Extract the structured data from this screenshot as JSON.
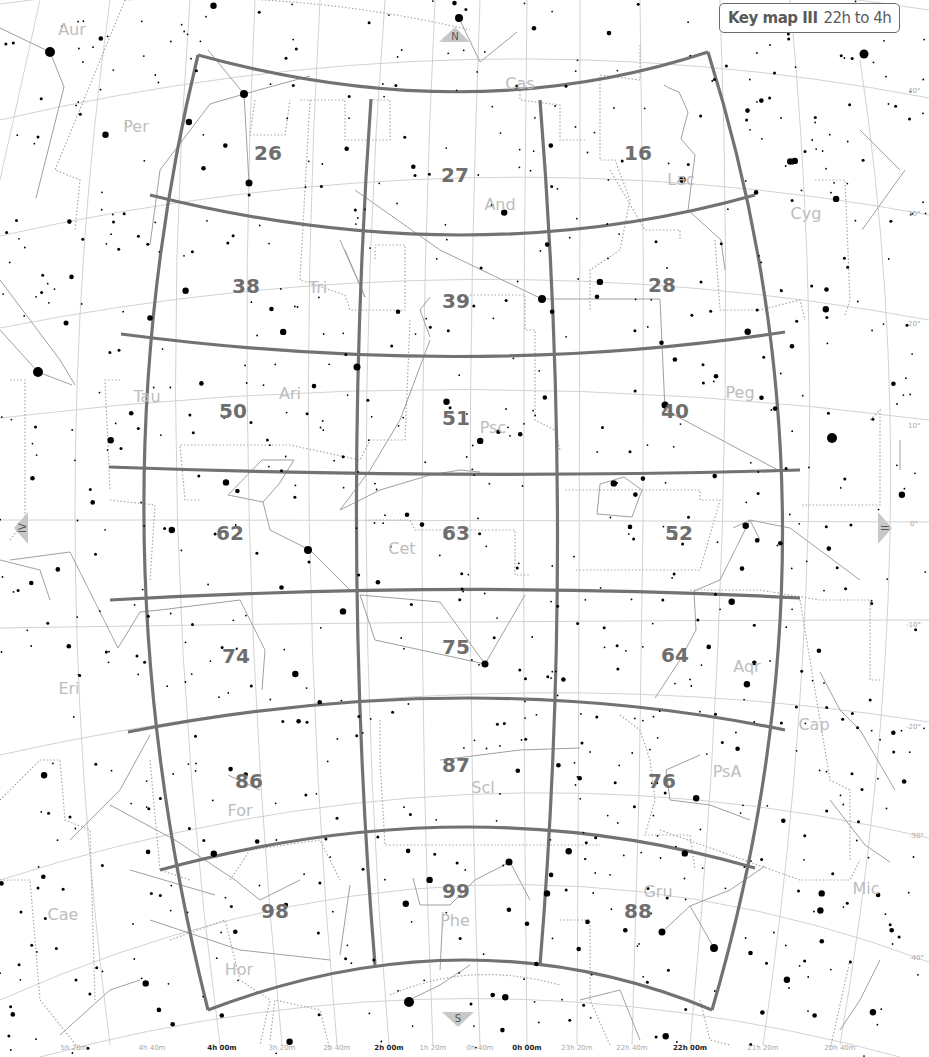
{
  "key_map": {
    "title": "Key map III",
    "range": "22h to 4h"
  },
  "direction_markers": {
    "north": "N",
    "south": "S",
    "east": "IV",
    "west": "II"
  },
  "chart_numbers": [
    {
      "label": "26",
      "x": 268,
      "y": 160
    },
    {
      "label": "27",
      "x": 455,
      "y": 182
    },
    {
      "label": "16",
      "x": 638,
      "y": 160
    },
    {
      "label": "38",
      "x": 246,
      "y": 293
    },
    {
      "label": "39",
      "x": 456,
      "y": 308
    },
    {
      "label": "28",
      "x": 662,
      "y": 292
    },
    {
      "label": "50",
      "x": 233,
      "y": 418
    },
    {
      "label": "51",
      "x": 456,
      "y": 425
    },
    {
      "label": "40",
      "x": 675,
      "y": 418
    },
    {
      "label": "62",
      "x": 230,
      "y": 540
    },
    {
      "label": "63",
      "x": 456,
      "y": 540
    },
    {
      "label": "52",
      "x": 679,
      "y": 540
    },
    {
      "label": "74",
      "x": 236,
      "y": 663
    },
    {
      "label": "75",
      "x": 456,
      "y": 654
    },
    {
      "label": "64",
      "x": 675,
      "y": 662
    },
    {
      "label": "86",
      "x": 249,
      "y": 788
    },
    {
      "label": "87",
      "x": 456,
      "y": 772
    },
    {
      "label": "76",
      "x": 662,
      "y": 788
    },
    {
      "label": "98",
      "x": 275,
      "y": 918
    },
    {
      "label": "99",
      "x": 456,
      "y": 898
    },
    {
      "label": "88",
      "x": 638,
      "y": 918
    }
  ],
  "constellations": [
    {
      "abbr": "Aur",
      "x": 72,
      "y": 35
    },
    {
      "abbr": "Per",
      "x": 136,
      "y": 132
    },
    {
      "abbr": "Cas",
      "x": 520,
      "y": 89
    },
    {
      "abbr": "And",
      "x": 500,
      "y": 210
    },
    {
      "abbr": "Lac",
      "x": 681,
      "y": 185
    },
    {
      "abbr": "Cyg",
      "x": 806,
      "y": 219
    },
    {
      "abbr": "Tri",
      "x": 318,
      "y": 293
    },
    {
      "abbr": "Tau",
      "x": 147,
      "y": 402
    },
    {
      "abbr": "Ari",
      "x": 290,
      "y": 399
    },
    {
      "abbr": "Psc",
      "x": 493,
      "y": 433
    },
    {
      "abbr": "Peg",
      "x": 740,
      "y": 398
    },
    {
      "abbr": "Cet",
      "x": 402,
      "y": 554
    },
    {
      "abbr": "Eri",
      "x": 69,
      "y": 694
    },
    {
      "abbr": "Aqr",
      "x": 747,
      "y": 672
    },
    {
      "abbr": "Cap",
      "x": 814,
      "y": 730
    },
    {
      "abbr": "For",
      "x": 240,
      "y": 816
    },
    {
      "abbr": "Scl",
      "x": 483,
      "y": 793
    },
    {
      "abbr": "PsA",
      "x": 727,
      "y": 777
    },
    {
      "abbr": "Mic",
      "x": 866,
      "y": 894
    },
    {
      "abbr": "Cae",
      "x": 63,
      "y": 920
    },
    {
      "abbr": "Phe",
      "x": 455,
      "y": 926
    },
    {
      "abbr": "Gru",
      "x": 658,
      "y": 897
    },
    {
      "abbr": "Hor",
      "x": 239,
      "y": 975
    }
  ],
  "declination_labels": [
    {
      "label": "40°",
      "x": 908,
      "y": 93
    },
    {
      "label": "30°",
      "x": 908,
      "y": 216
    },
    {
      "label": "20°",
      "x": 908,
      "y": 326
    },
    {
      "label": "10°",
      "x": 908,
      "y": 428
    },
    {
      "label": "0°",
      "x": 910,
      "y": 526
    },
    {
      "label": "-10°",
      "x": 906,
      "y": 627
    },
    {
      "label": "-20°",
      "x": 906,
      "y": 729
    },
    {
      "label": "-30°",
      "x": 909,
      "y": 838
    },
    {
      "label": "-40°",
      "x": 909,
      "y": 960
    }
  ],
  "ra_labels": [
    {
      "label": "5h 20m",
      "x": 74,
      "y": 1050,
      "major": false
    },
    {
      "label": "4h 40m",
      "x": 152,
      "y": 1050,
      "major": false
    },
    {
      "label": "4h 00m",
      "x": 222,
      "y": 1050,
      "major": true
    },
    {
      "label": "3h 20m",
      "x": 282,
      "y": 1050,
      "major": false
    },
    {
      "label": "2h 40m",
      "x": 337,
      "y": 1050,
      "major": false
    },
    {
      "label": "2h 00m",
      "x": 389,
      "y": 1050,
      "major": true
    },
    {
      "label": "1h 20m",
      "x": 433,
      "y": 1050,
      "major": false
    },
    {
      "label": "0h 40m",
      "x": 480,
      "y": 1050,
      "major": false
    },
    {
      "label": "0h 00m",
      "x": 527,
      "y": 1050,
      "major": true
    },
    {
      "label": "23h 20m",
      "x": 577,
      "y": 1050,
      "major": false
    },
    {
      "label": "22h 40m",
      "x": 632,
      "y": 1050,
      "major": false
    },
    {
      "label": "22h 00m",
      "x": 690,
      "y": 1050,
      "major": true
    },
    {
      "label": "21h 20m",
      "x": 763,
      "y": 1050,
      "major": false
    },
    {
      "label": "20h 40m",
      "x": 840,
      "y": 1050,
      "major": false
    }
  ],
  "colors": {
    "grid_border": "#707070",
    "graticule": "#cfcfcf",
    "constellation_boundary": "#9a9a9a",
    "constellation_lines": "#a0a0a0",
    "stars": "#000000",
    "chart_number": "#6e6e6e",
    "constellation_name": "#bdbdbd",
    "marker_fill": "#c8c8c8"
  }
}
